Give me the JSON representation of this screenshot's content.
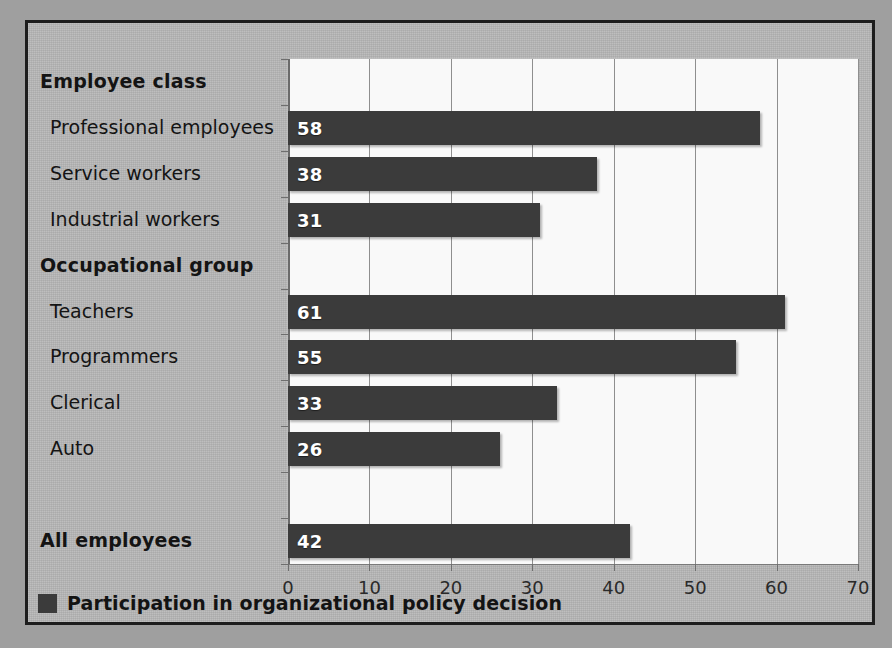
{
  "chart_data": {
    "type": "bar",
    "orientation": "horizontal",
    "title": "",
    "xlabel": "",
    "ylabel": "",
    "xlim": [
      0,
      70
    ],
    "xticks": [
      0,
      10,
      20,
      30,
      40,
      50,
      60,
      70
    ],
    "grid": true,
    "legend": {
      "position": "bottom-left",
      "entries": [
        {
          "label": "Participation in organizational policy decision",
          "color": "#3b3b3b"
        }
      ]
    },
    "series": [
      {
        "name": "Participation in organizational policy decision",
        "color": "#3b3b3b",
        "values": [
          58,
          38,
          31,
          61,
          55,
          33,
          26,
          42
        ]
      }
    ],
    "categories": [
      "Professional employees",
      "Service workers",
      "Industrial workers",
      "Teachers",
      "Programmers",
      "Clerical",
      "Auto",
      "All employees"
    ],
    "rows": [
      {
        "label": "Employee class",
        "kind": "header",
        "value": null
      },
      {
        "label": "Professional employees",
        "kind": "item",
        "value": 58
      },
      {
        "label": "Service workers",
        "kind": "item",
        "value": 38
      },
      {
        "label": "Industrial workers",
        "kind": "item",
        "value": 31
      },
      {
        "label": "Occupational group",
        "kind": "header",
        "value": null
      },
      {
        "label": "Teachers",
        "kind": "item",
        "value": 61
      },
      {
        "label": "Programmers",
        "kind": "item",
        "value": 55
      },
      {
        "label": "Clerical",
        "kind": "item",
        "value": 33
      },
      {
        "label": "Auto",
        "kind": "item",
        "value": 26
      },
      {
        "label": "",
        "kind": "spacer",
        "value": null
      },
      {
        "label": "All employees",
        "kind": "total",
        "value": 42
      }
    ],
    "colors": {
      "bar": "#3b3b3b",
      "plot_background": "#f9f9f9",
      "chart_background": "#b6b6b6",
      "border": "#1d1d1d",
      "gridline": "#8f8f8f",
      "value_label": "#ffffff",
      "text": "#141414"
    }
  }
}
